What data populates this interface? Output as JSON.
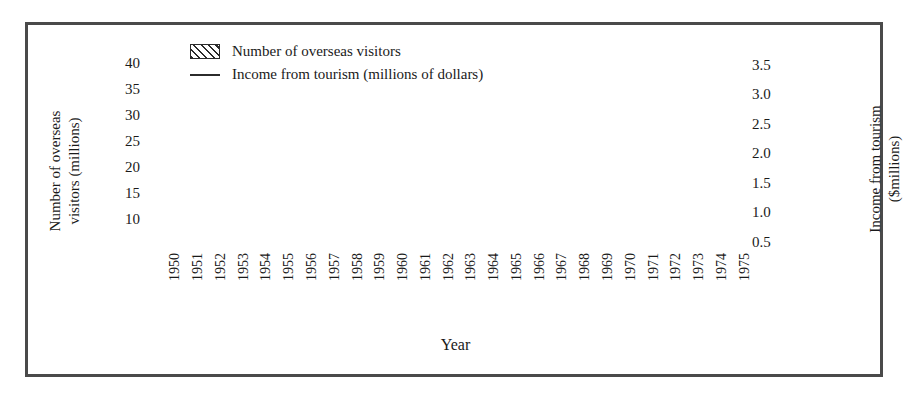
{
  "chart_data": {
    "type": "bar",
    "title": "",
    "xlabel": "Year",
    "ylabel": "Number of overseas visitors (millions)",
    "ylabel_right": "Income from tourism ($millions)",
    "categories": [
      "1950",
      "1951",
      "1952",
      "1953",
      "1954",
      "1955",
      "1956",
      "1957",
      "1958",
      "1959",
      "1960",
      "1961",
      "1962",
      "1963",
      "1964",
      "1965",
      "1966",
      "1967",
      "1968",
      "1969",
      "1970",
      "1971",
      "1972",
      "1973",
      "1974",
      "1975"
    ],
    "ylim": [
      0,
      42
    ],
    "yticks": [
      "10",
      "15",
      "20",
      "25",
      "30",
      "35",
      "40"
    ],
    "ytick_values": [
      10,
      15,
      20,
      25,
      30,
      35,
      40
    ],
    "ylim_right": [
      0,
      3.7
    ],
    "yticks_right": [
      "0.5",
      "1.0",
      "1.5",
      "2.0",
      "2.5",
      "3.0",
      "3.5"
    ],
    "ytick_values_right": [
      0.5,
      1.0,
      1.5,
      2.0,
      2.5,
      3.0,
      3.5
    ],
    "grid": false,
    "legend_position": "top-left",
    "series": [
      {
        "name": "Number of overseas visitors",
        "type": "bar",
        "axis": "left",
        "units": "millions",
        "values": [
          1.0,
          1.3,
          1.6,
          1.9,
          2.3,
          2.6,
          2.8,
          3.0,
          3.4,
          4.6,
          6.2,
          7.4,
          8.5,
          9.9,
          12.9,
          13.1,
          15.2,
          15.4,
          16.6,
          18.3,
          19.9,
          21.6,
          25.4,
          27.0,
          24.0,
          24.0
        ]
      },
      {
        "name": "Income from tourism (millions of dollars)",
        "type": "line",
        "axis": "right",
        "units": "$millions",
        "values": [
          0.05,
          0.06,
          0.07,
          0.09,
          0.1,
          0.12,
          0.14,
          0.16,
          0.19,
          0.24,
          0.31,
          0.4,
          0.52,
          0.66,
          0.83,
          1.02,
          1.23,
          1.26,
          1.22,
          1.26,
          1.45,
          1.8,
          2.32,
          2.85,
          3.25,
          3.5
        ]
      }
    ],
    "legend": [
      {
        "label": "Number of overseas visitors",
        "marker": "hatched-swatch"
      },
      {
        "label": "Income from tourism (millions of dollars)",
        "marker": "line"
      }
    ],
    "colors": {
      "ink": "#2b2b2b",
      "frame": "#4a4a4a",
      "background": "#ffffff",
      "bar_hatch": "#2b2b2b",
      "line": "#2b2b2b"
    }
  }
}
